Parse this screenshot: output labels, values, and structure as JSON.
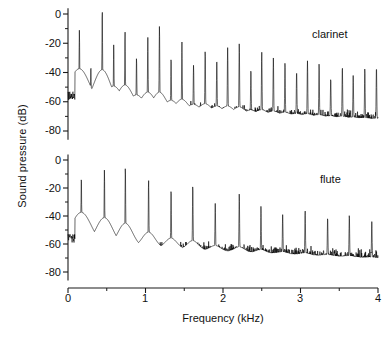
{
  "figure": {
    "xlabel": "Frequency (kHz)",
    "ylabel": "Sound pressure (dB)"
  },
  "panels": {
    "top_tag": "clarinet",
    "bottom_tag": "flute"
  },
  "axis": {
    "y_ticks": [
      "0",
      "-20",
      "-40",
      "-60",
      "-80"
    ],
    "x_ticks": [
      "0",
      "1",
      "2",
      "3",
      "4"
    ]
  },
  "chart_data": {
    "type": "line",
    "title": "",
    "xlabel": "Frequency (kHz)",
    "ylabel": "Sound pressure (dB)",
    "xlim": [
      0,
      4
    ],
    "ylim": [
      -88,
      4
    ],
    "grid": false,
    "legend_position": "inside-top-right",
    "panels": [
      {
        "name": "clarinet",
        "label": "clarinet",
        "fundamental_khz": 0.147,
        "noise_floor_db": [
          -62,
          -72
        ],
        "peaks": [
          {
            "f": 0.147,
            "db": -11
          },
          {
            "f": 0.295,
            "db": -36
          },
          {
            "f": 0.442,
            "db": 3
          },
          {
            "f": 0.59,
            "db": -21
          },
          {
            "f": 0.736,
            "db": -12
          },
          {
            "f": 0.884,
            "db": -30
          },
          {
            "f": 1.03,
            "db": -16
          },
          {
            "f": 1.18,
            "db": -8
          },
          {
            "f": 1.33,
            "db": -30
          },
          {
            "f": 1.47,
            "db": -19
          },
          {
            "f": 1.62,
            "db": -35
          },
          {
            "f": 1.77,
            "db": -25
          },
          {
            "f": 1.92,
            "db": -31
          },
          {
            "f": 2.06,
            "db": -23
          },
          {
            "f": 2.21,
            "db": -20
          },
          {
            "f": 2.36,
            "db": -38
          },
          {
            "f": 2.5,
            "db": -26
          },
          {
            "f": 2.65,
            "db": -30
          },
          {
            "f": 2.8,
            "db": -33
          },
          {
            "f": 2.95,
            "db": -39
          },
          {
            "f": 3.09,
            "db": -32
          },
          {
            "f": 3.24,
            "db": -34
          },
          {
            "f": 3.39,
            "db": -44
          },
          {
            "f": 3.54,
            "db": -36
          },
          {
            "f": 3.68,
            "db": -42
          },
          {
            "f": 3.83,
            "db": -37
          },
          {
            "f": 3.98,
            "db": -36
          }
        ]
      },
      {
        "name": "flute",
        "label": "flute",
        "fundamental_khz": 0.172,
        "noise_floor_db": [
          -60,
          -70
        ],
        "peaks": [
          {
            "f": 0.172,
            "db": -12
          },
          {
            "f": 0.47,
            "db": -7
          },
          {
            "f": 0.74,
            "db": -5
          },
          {
            "f": 1.04,
            "db": -14
          },
          {
            "f": 1.33,
            "db": -21
          },
          {
            "f": 1.61,
            "db": -18
          },
          {
            "f": 1.9,
            "db": -31
          },
          {
            "f": 2.21,
            "db": -24
          },
          {
            "f": 2.49,
            "db": -33
          },
          {
            "f": 2.77,
            "db": -39
          },
          {
            "f": 3.06,
            "db": -36
          },
          {
            "f": 3.35,
            "db": -41
          },
          {
            "f": 3.63,
            "db": -39
          },
          {
            "f": 3.92,
            "db": -44
          }
        ]
      }
    ]
  }
}
